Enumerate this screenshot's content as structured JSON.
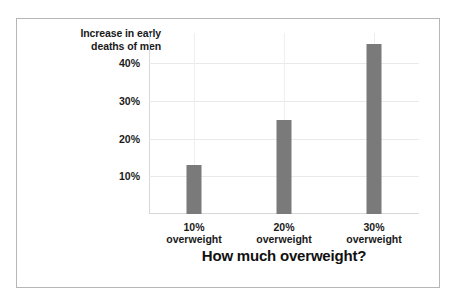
{
  "chart_data": {
    "type": "bar",
    "title": "",
    "xlabel": "How much overweight?",
    "ylabel": "Increase in early deaths of men",
    "ylabel_lines": [
      "Increase in early",
      "deaths of men"
    ],
    "categories": [
      "10% overweight",
      "20% overweight",
      "30% overweight"
    ],
    "category_lines": [
      [
        "10%",
        "overweight"
      ],
      [
        "20%",
        "overweight"
      ],
      [
        "30%",
        "overweight"
      ]
    ],
    "values": [
      13,
      25,
      45
    ],
    "value_labels": [
      "13%",
      "25%",
      "45%"
    ],
    "ylim": [
      0,
      48
    ],
    "yticks": [
      10,
      20,
      30,
      40
    ],
    "ytick_labels": [
      "10%",
      "20%",
      "30%",
      "40%"
    ],
    "grid": true,
    "grid_axis": "both",
    "legend": false,
    "bar_color": "#7a7a7a",
    "text_color": "#1a1a1a",
    "grid_color": "#e9e9e9",
    "axis_color": "#d8d8d8",
    "frame_color": "#b6b6b6",
    "background": "#ffffff"
  }
}
